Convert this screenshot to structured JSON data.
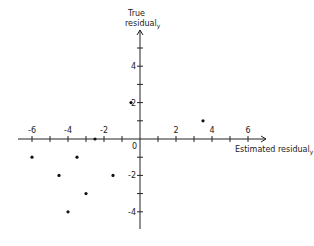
{
  "chart_data": {
    "type": "scatter",
    "title": "",
    "xlabel": "Estimated residual",
    "xlabel_sub": "y",
    "ylabel_line1": "True",
    "ylabel_line2": "residual",
    "ylabel_sub": "y",
    "xlim": [
      -6.6,
      7.2
    ],
    "ylim": [
      -5,
      6
    ],
    "x_ticks": [
      -6,
      -5,
      -4,
      -3,
      -2,
      -1,
      1,
      2,
      3,
      4,
      5,
      6
    ],
    "x_tick_labels": {
      "-6": "-6",
      "-4": "-4",
      "-2": "-2",
      "2": "2",
      "4": "4",
      "6": "6"
    },
    "y_ticks": [
      -4,
      -3,
      -2,
      -1,
      1,
      2,
      3,
      4,
      5
    ],
    "y_tick_labels": {
      "-4": "-4",
      "-2": "-2",
      "2": "2",
      "4": "4"
    },
    "origin_label": "0",
    "grid": false,
    "points": [
      {
        "x": -6,
        "y": -1
      },
      {
        "x": -4.5,
        "y": -2
      },
      {
        "x": -4,
        "y": -4
      },
      {
        "x": -3.5,
        "y": -1
      },
      {
        "x": -3,
        "y": -3
      },
      {
        "x": -2.5,
        "y": 0
      },
      {
        "x": -1.5,
        "y": -2
      },
      {
        "x": -0.5,
        "y": 2
      },
      {
        "x": 3.5,
        "y": 1
      }
    ]
  },
  "layout": {
    "origin_px": [
      140,
      139
    ],
    "unit_px_x": 18,
    "unit_px_y": 18.2,
    "ink_color": "#222222"
  }
}
